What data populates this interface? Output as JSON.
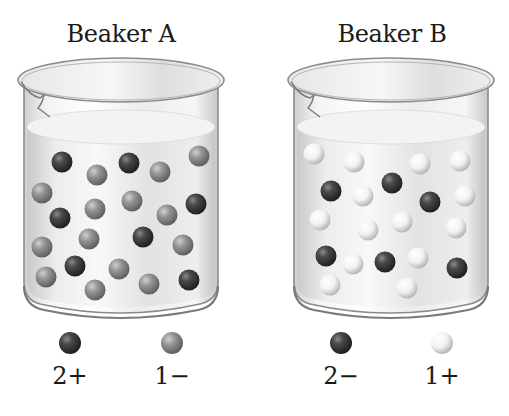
{
  "beakers": [
    {
      "title": "Beaker A",
      "legend": [
        {
          "type": "cation",
          "charge": "2+",
          "shade": "dark"
        },
        {
          "type": "anion",
          "charge": "1−",
          "shade": "medium"
        }
      ],
      "particle_counts": {
        "dark_2plus": 7,
        "medium_1minus": 14
      }
    },
    {
      "title": "Beaker B",
      "legend": [
        {
          "type": "anion",
          "charge": "2−",
          "shade": "dark"
        },
        {
          "type": "cation",
          "charge": "1+",
          "shade": "white"
        }
      ],
      "particle_counts": {
        "dark_2minus": 6,
        "white_1plus": 14
      }
    }
  ],
  "colors": {
    "dark_ball": "#3a3a3a",
    "medium_ball": "#8c8c8c",
    "white_ball": "#f0f0f0",
    "glass_outline": "#8a8a8a",
    "liquid": "#e6e6e6",
    "text": "#1a1a1a"
  }
}
